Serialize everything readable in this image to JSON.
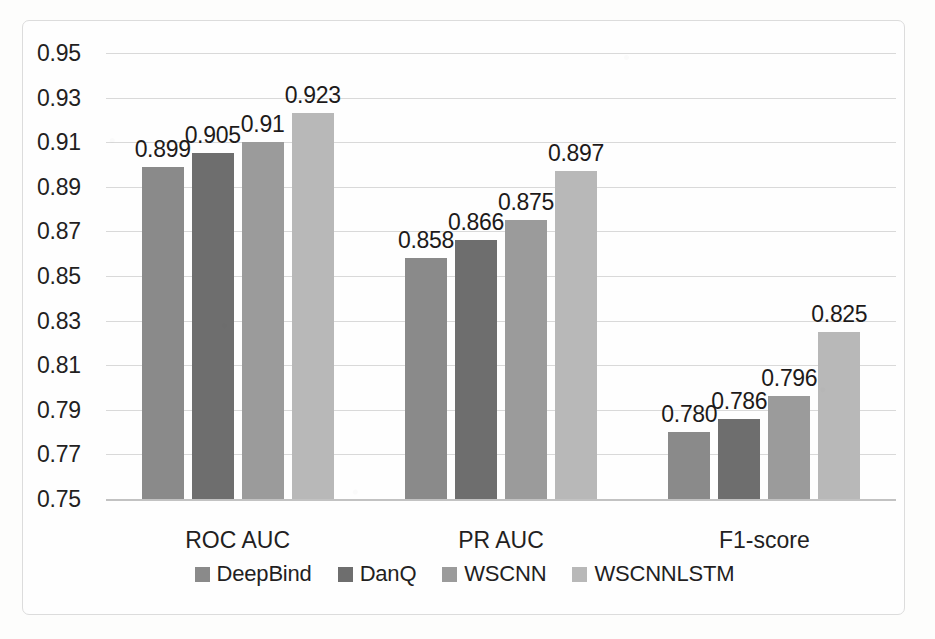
{
  "chart_data": {
    "type": "bar",
    "title": "",
    "xlabel": "",
    "ylabel": "",
    "categories": [
      "ROC AUC",
      "PR AUC",
      "F1-score"
    ],
    "series": [
      {
        "name": "DeepBind",
        "color": "#8a8a8a",
        "values": [
          0.899,
          0.858,
          0.78
        ],
        "labels": [
          "0.899",
          "0.858",
          "0.780"
        ]
      },
      {
        "name": "DanQ",
        "color": "#6e6e6e",
        "values": [
          0.905,
          0.866,
          0.786
        ],
        "labels": [
          "0.905",
          "0.866",
          "0.786"
        ]
      },
      {
        "name": "WSCNN",
        "color": "#9b9b9b",
        "values": [
          0.91,
          0.875,
          0.796
        ],
        "labels": [
          "0.91",
          "0.875",
          "0.796"
        ]
      },
      {
        "name": "WSCNNLSTM",
        "color": "#b8b8b8",
        "values": [
          0.923,
          0.897,
          0.825
        ],
        "labels": [
          "0.923",
          "0.897",
          "0.825"
        ]
      }
    ],
    "ylim": [
      0.75,
      0.95
    ],
    "ytick_step": 0.02,
    "ytick_labels": [
      "0.95",
      "0.93",
      "0.91",
      "0.89",
      "0.87",
      "0.85",
      "0.83",
      "0.81",
      "0.79",
      "0.77",
      "0.75"
    ],
    "grid": true,
    "legend_position": "bottom"
  },
  "axis": {
    "y_ticks": [
      "0.95",
      "0.93",
      "0.91",
      "0.89",
      "0.87",
      "0.85",
      "0.83",
      "0.81",
      "0.79",
      "0.77",
      "0.75"
    ]
  },
  "legend": {
    "items": [
      {
        "label": "DeepBind",
        "color": "#8a8a8a"
      },
      {
        "label": "DanQ",
        "color": "#6e6e6e"
      },
      {
        "label": "WSCNN",
        "color": "#9b9b9b"
      },
      {
        "label": "WSCNNLSTM",
        "color": "#b8b8b8"
      }
    ]
  },
  "colors": {
    "frame": "#dcdcdc",
    "gridline": "#d9d9d9",
    "baseline": "#c2c2c2",
    "text": "#231f1f",
    "background": "#fdfdfc"
  }
}
